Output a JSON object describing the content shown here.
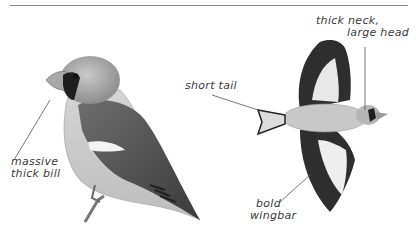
{
  "plate": {
    "subject": "Hawfinch",
    "figures": [
      "perched adult",
      "flying adult (underside)"
    ]
  },
  "annotations": {
    "neck_head_line1": "thick neck,",
    "neck_head_line2": "large head",
    "tail": "short tail",
    "bill_line1": "massive",
    "bill_line2": "thick bill",
    "wingbar_line1": "bold",
    "wingbar_line2": "wingbar"
  },
  "colors": {
    "rule": "#8a8a8a",
    "label": "#3a3a3a",
    "leader": "#555555"
  }
}
